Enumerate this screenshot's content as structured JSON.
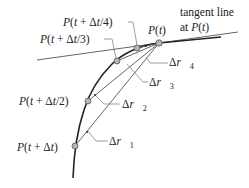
{
  "diagram": {
    "title_label_line1": "tangent line",
    "title_label_line2": "at P(t)",
    "points": [
      {
        "id": "p0",
        "label": "P(t)",
        "x": 159,
        "y": 43
      },
      {
        "id": "p4",
        "label": "P(t + Δt/4)",
        "x": 137,
        "y": 48
      },
      {
        "id": "p3",
        "label": "P(t + Δt/3)",
        "x": 117,
        "y": 61
      },
      {
        "id": "p2",
        "label": "P(t + Δt/2)",
        "x": 88,
        "y": 101
      },
      {
        "id": "p1",
        "label": "P(t + Δt)",
        "x": 75,
        "y": 146
      }
    ],
    "vectors": [
      {
        "label": "Δr⃗",
        "sub": "4"
      },
      {
        "label": "Δr⃗",
        "sub": "3"
      },
      {
        "label": "Δr⃗",
        "sub": "2"
      },
      {
        "label": "Δr⃗",
        "sub": "1"
      }
    ],
    "colors": {
      "line": "#444444",
      "curve": "#222222",
      "point_fill": "#b5b5b5",
      "point_stroke": "#555555"
    }
  }
}
